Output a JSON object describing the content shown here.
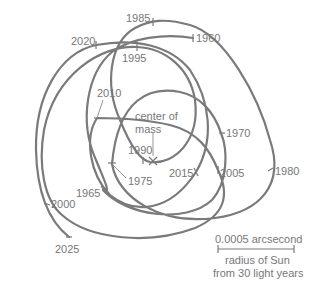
{
  "diagram": {
    "center_label_line1": "center of",
    "center_label_line2": "mass",
    "center_marker": "x-mark",
    "years": {
      "y1960": "1960",
      "y1965": "1965",
      "y1970": "1970",
      "y1975": "1975",
      "y1980": "1980",
      "y1985": "1985",
      "y1990": "1990",
      "y1995": "1995",
      "y2000": "2000",
      "y2005": "2005",
      "y2010": "2010",
      "y2015": "2015",
      "y2020": "2020",
      "y2025": "2025"
    },
    "scale_bar": {
      "top_label": "0.0005 arcsecond",
      "bottom_label_line1": "radius of Sun",
      "bottom_label_line2": "from 30 light years"
    },
    "colors": {
      "line": "#7a7a7a",
      "text": "#777777",
      "background": "#ffffff"
    }
  }
}
